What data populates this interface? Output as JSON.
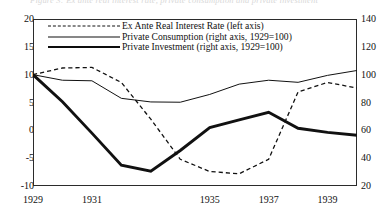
{
  "figure": {
    "top_caption_partial": "Figure 3: Ex ante real interest rate, private consumption and private investment"
  },
  "chart_data": {
    "type": "line",
    "title": "",
    "xlabel": "",
    "ylabel_left": "",
    "ylabel_right": "",
    "xlim": [
      1929,
      1940
    ],
    "ylim_left": [
      -10,
      20
    ],
    "ylim_right": [
      20,
      140
    ],
    "left_axis_ticks": [
      "20",
      "15",
      "10",
      "5",
      "0",
      "-5",
      "-10"
    ],
    "left_axis_tick_values": [
      20,
      15,
      10,
      5,
      0,
      -5,
      -10
    ],
    "right_axis_ticks": [
      "140",
      "120",
      "100",
      "80",
      "60",
      "40",
      "20"
    ],
    "right_axis_tick_values": [
      140,
      120,
      100,
      80,
      60,
      40,
      20
    ],
    "x_tick_labels": [
      "1929",
      "1931",
      "1935",
      "1937",
      "1939"
    ],
    "x_tick_values": [
      1929,
      1931,
      1935,
      1937,
      1939
    ],
    "x": [
      1929,
      1930,
      1931,
      1932,
      1933,
      1934,
      1935,
      1936,
      1937,
      1938,
      1939,
      1940
    ],
    "grid": false,
    "legend_position": "top-left",
    "series": [
      {
        "name": "Ex Ante Real Interest Rate (left axis)",
        "axis": "left",
        "style": "dashed",
        "values": [
          10.0,
          11.2,
          11.3,
          8.6,
          2.0,
          -5.2,
          -7.4,
          -7.8,
          -5.2,
          6.9,
          8.6,
          7.6
        ]
      },
      {
        "name": "Private Consumption (right axis, 1929=100)",
        "axis": "right",
        "style": "thin",
        "values": [
          100.0,
          96.0,
          95.6,
          83.0,
          80.4,
          80.2,
          85.8,
          93.2,
          96.0,
          94.5,
          99.5,
          103.0
        ]
      },
      {
        "name": "Private Investment (right axis, 1929=100)",
        "axis": "right",
        "style": "thick",
        "values": [
          100.0,
          80.5,
          58.0,
          35.0,
          30.6,
          45.5,
          62.0,
          67.5,
          73.0,
          61.5,
          58.5,
          56.5
        ]
      }
    ]
  },
  "legend": {
    "items": [
      {
        "label": "Ex Ante Real Interest Rate (left axis)",
        "style": "dashed"
      },
      {
        "label": "Private Consumption (right axis, 1929=100)",
        "style": "thin"
      },
      {
        "label": "Private Investment (right axis, 1929=100)",
        "style": "thick"
      }
    ]
  },
  "colors": {
    "line": "#111111",
    "frame": "#2b2b2b",
    "background": "#ffffff"
  }
}
